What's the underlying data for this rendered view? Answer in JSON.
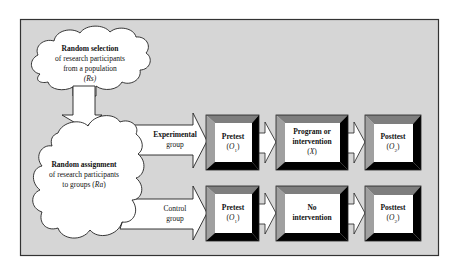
{
  "colors": {
    "panel_bg": "#d6d6d6",
    "panel_border": "#333333",
    "box_top_bevel": "#7e7e7e",
    "box_left_bevel": "#a0a0a0",
    "box_dark_bevel": "#000000",
    "box_face": "#ffffff",
    "cloud_fill": "#ffffff"
  },
  "selection_cloud": {
    "line1": "Random selection",
    "line2": "of research participants",
    "line3": "from a population",
    "symbol": "(Rs)"
  },
  "assignment_cloud": {
    "line1_prefix": "Random ",
    "line1_bold": "assignment",
    "line2": "of research participants",
    "line3_prefix": "to groups (",
    "line3_symbol": "Ra",
    "line3_suffix": ")"
  },
  "experimental_row": {
    "label_line1": "Experimental",
    "label_line2": "group",
    "pretest": {
      "title": "Pretest",
      "symbol": "(O1)",
      "sym_letter": "O",
      "sym_sub": "1"
    },
    "treatment": {
      "line1": "Program or",
      "line2": "intervention",
      "symbol": "(X)",
      "sym_letter": "X"
    },
    "posttest": {
      "title": "Posttest",
      "symbol": "(O2)",
      "sym_letter": "O",
      "sym_sub": "2"
    }
  },
  "control_row": {
    "label_line1": "Control",
    "label_line2": "group",
    "pretest": {
      "title": "Pretest",
      "symbol": "(O1)",
      "sym_letter": "O",
      "sym_sub": "1"
    },
    "treatment": {
      "line1": "No",
      "line2": "intervention"
    },
    "posttest": {
      "title": "Posttest",
      "symbol": "(O2)",
      "sym_letter": "O",
      "sym_sub": "2"
    }
  }
}
